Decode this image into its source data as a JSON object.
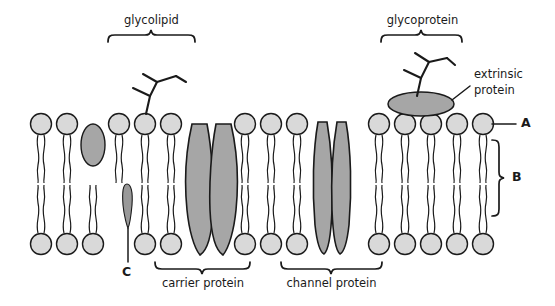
{
  "diagram": {
    "labels": {
      "glycolipid": "glycolipid",
      "glycoprotein": "glycoprotein",
      "extrinsic_protein_line1": "extrinsic",
      "extrinsic_protein_line2": "protein",
      "carrier_protein": "carrier protein",
      "channel_protein": "channel protein",
      "marker_a": "A",
      "marker_b": "B",
      "marker_c": "C"
    },
    "colors": {
      "head_fill": "#d9d9d9",
      "protein_fill": "#a6a6a6",
      "stroke": "#1a1a1a",
      "background": "#ffffff"
    },
    "structure": {
      "bilayer_rows": 2,
      "phospholipid_head_count_top": 23,
      "phospholipid_head_count_bottom": 23,
      "intrinsic_proteins": 2,
      "embedded_cholesterol": 1
    }
  }
}
